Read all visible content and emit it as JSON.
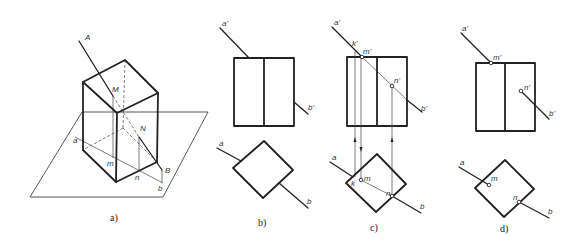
{
  "figure": {
    "panels": [
      {
        "id": "a",
        "caption": "a)",
        "type": "isometric",
        "labels": {
          "A": "A",
          "M": "M",
          "N": "N",
          "B": "B",
          "a": "a",
          "m": "m",
          "n": "n",
          "b": "b"
        }
      },
      {
        "id": "b",
        "caption": "b)",
        "type": "orthographic",
        "labels": {
          "a_prime": "a'",
          "b_prime": "b'",
          "a": "a",
          "b": "b"
        }
      },
      {
        "id": "c",
        "caption": "c)",
        "type": "orthographic-construction",
        "labels": {
          "a_prime": "a'",
          "k_prime": "k'",
          "m_prime": "m'",
          "n_prime": "n'",
          "b_prime": "b'",
          "a": "a",
          "k": "k",
          "m": "m",
          "n": "n",
          "b": "b"
        }
      },
      {
        "id": "d",
        "caption": "d)",
        "type": "orthographic-result",
        "labels": {
          "a_prime": "a'",
          "m_prime": "m'",
          "n_prime": "n'",
          "b_prime": "b'",
          "a": "a",
          "m": "m",
          "n": "n",
          "b": "b"
        }
      }
    ],
    "colors": {
      "line": "#222222",
      "background": "#ffffff"
    }
  }
}
